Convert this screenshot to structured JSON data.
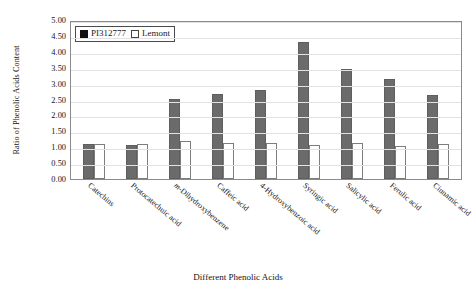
{
  "chart_data": {
    "type": "bar",
    "title": "",
    "xlabel": "Different Phenolic Acids",
    "ylabel": "Ratio of Phenolic Acids Content",
    "categories": [
      "Catechins",
      "Protocatechuic acid",
      "m-Dihydroxybenzene",
      "Caffeic acid",
      "4-Hydroxybenzoic acid",
      "Syringic acid",
      "Salicylic acid",
      "Ferulic acid",
      "Cinnamic acid"
    ],
    "series": [
      {
        "name": "PI312777",
        "color": "#6b6b6b",
        "values": [
          1.12,
          1.08,
          2.55,
          2.7,
          2.85,
          4.35,
          3.5,
          3.2,
          2.68
        ]
      },
      {
        "name": "Lemont",
        "color": "#ffffff",
        "values": [
          1.12,
          1.13,
          1.22,
          1.15,
          1.15,
          1.08,
          1.15,
          1.05,
          1.12
        ]
      }
    ],
    "ylim": [
      0.0,
      5.0
    ],
    "ytick_step": 0.5,
    "yticks": [
      "0.00",
      "0.50",
      "1.00",
      "1.50",
      "2.00",
      "2.50",
      "3.00",
      "3.50",
      "4.00",
      "4.50",
      "5.00"
    ],
    "grid": true,
    "legend_position": "top-left"
  }
}
